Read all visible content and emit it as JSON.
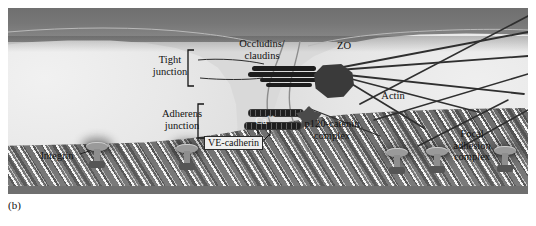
{
  "figure": {
    "caption": "(b)"
  },
  "regions": {
    "lumen": "vessel-lumen",
    "cell_left": "endothelial-cell-left",
    "cell_right": "endothelial-cell-right",
    "matrix": "extracellular-matrix"
  },
  "labels": {
    "tight_junction": "Tight\njunction",
    "adherens_junction": "Adherens\njunction",
    "occludins_claudins": "Occludins/\nclaudins",
    "zo": "ZO",
    "actin": "Actin",
    "calcium": "Ca",
    "calcium_charge": "++",
    "ve_cadherin": "VE-cadherin",
    "p120_catenin": "p120-catenin\ncomplex",
    "integrin": "Integrin",
    "focal_adhesion": "Focal\nadhesion\ncomplex"
  },
  "colors": {
    "lumen": "#777777",
    "cell": "#e4e4e4",
    "matrix": "#6f6f6f",
    "protein_dark": "#1d1d1d",
    "receptor": "#9a9a9a",
    "text": "#111111",
    "panel_bg": "#d9d9d9"
  },
  "structures": {
    "occludin_bars": 4,
    "cadherin_bars": 2,
    "receptor_count": 5,
    "actin_filaments": 9
  }
}
